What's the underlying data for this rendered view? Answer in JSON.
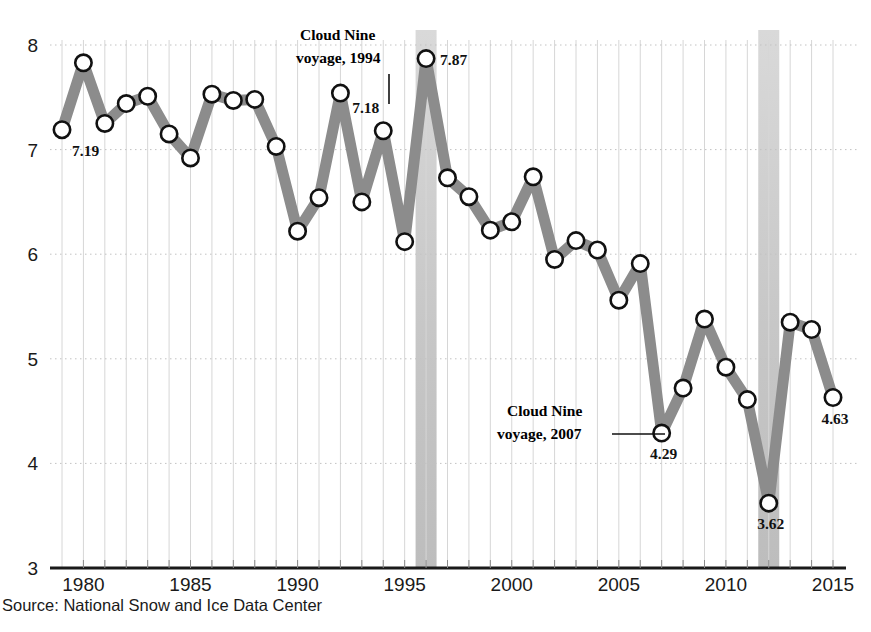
{
  "chart_data": {
    "type": "line",
    "title": "",
    "subtitle_cropped": "(millions of square kilometers)",
    "xlabel": "",
    "ylabel": "",
    "xlim": [
      1978.6,
      2015.6
    ],
    "ylim": [
      3,
      8
    ],
    "grid": true,
    "legend": null,
    "x": [
      1979,
      1980,
      1981,
      1982,
      1983,
      1984,
      1985,
      1986,
      1987,
      1988,
      1989,
      1990,
      1991,
      1992,
      1993,
      1994,
      1995,
      1996,
      1997,
      1998,
      1999,
      2000,
      2001,
      2002,
      2003,
      2004,
      2005,
      2006,
      2007,
      2008,
      2009,
      2010,
      2011,
      2012,
      2013,
      2014,
      2015
    ],
    "values": [
      7.19,
      7.83,
      7.25,
      7.44,
      7.51,
      7.15,
      6.92,
      7.53,
      7.47,
      7.48,
      7.03,
      6.22,
      6.54,
      7.54,
      6.5,
      7.18,
      6.12,
      7.87,
      6.73,
      6.55,
      6.23,
      6.31,
      6.74,
      5.95,
      6.13,
      6.04,
      5.56,
      5.91,
      4.29,
      4.72,
      5.38,
      4.92,
      4.61,
      3.62,
      5.35,
      5.28,
      4.63
    ],
    "ytick_labels": [
      "8",
      "7",
      "6",
      "5",
      "4",
      "3"
    ],
    "ytick_values": [
      8,
      7,
      6,
      5,
      4,
      3
    ],
    "xtick_labels": [
      "1980",
      "1985",
      "1990",
      "1995",
      "2000",
      "2005",
      "2010",
      "2015"
    ],
    "xtick_values": [
      1980,
      1985,
      1990,
      1995,
      2000,
      2005,
      2010,
      2015
    ],
    "highlight_years": [
      1996,
      2012
    ],
    "data_labels": [
      {
        "year": 1979,
        "text": "7.19"
      },
      {
        "year": 1994,
        "text": "7.18"
      },
      {
        "year": 1996,
        "text": "7.87"
      },
      {
        "year": 2007,
        "text": "4.29"
      },
      {
        "year": 2012,
        "text": "3.62"
      },
      {
        "year": 2015,
        "text": "4.63"
      }
    ],
    "annotations": [
      {
        "id": "cloud-nine-1994",
        "line1": "Cloud Nine",
        "line2": "voyage, 1994",
        "target_year": 1994,
        "leader": "vertical"
      },
      {
        "id": "cloud-nine-2007",
        "line1": "Cloud Nine",
        "line2": "voyage, 2007",
        "target_year": 2007,
        "leader": "horizontal"
      }
    ],
    "colors": {
      "series": "#8c8c8c",
      "marker_fill": "#ffffff",
      "marker_stroke": "#111111",
      "axis": "#1a1a1a",
      "grid": "#cfcfcf",
      "highlight_band": "#c9c9c9",
      "text": "#1a1a1a"
    }
  },
  "source": {
    "text": "Source: National Snow and Ice Data Center"
  },
  "top_cropped_line": {
    "text": "(millions of square kilometers)"
  }
}
